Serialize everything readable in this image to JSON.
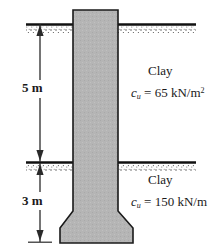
{
  "figure": {
    "colors": {
      "concrete_fill": "#b5b5b5",
      "outline": "#1a1a1a",
      "ground_line": "#111111",
      "stipple": "#4a4a4a",
      "text": "#1a1a1a",
      "background": "#ffffff"
    }
  },
  "dimensions": [
    {
      "name": "upper-layer-depth",
      "value": "5 m"
    },
    {
      "name": "lower-layer-depth",
      "value": "3 m"
    }
  ],
  "layers": [
    {
      "soil": "Clay",
      "cohesion_symbol": "c",
      "cohesion_subscript": "u",
      "equals": "=",
      "cohesion_value": "65",
      "cohesion_units": "kN/m",
      "cohesion_units_exponent": "2"
    },
    {
      "soil": "Clay",
      "cohesion_symbol": "c",
      "cohesion_subscript": "u",
      "equals": "=",
      "cohesion_value": "150",
      "cohesion_units": "kN/m",
      "cohesion_units_exponent": ""
    }
  ],
  "icons": {
    "ground_surface": "ground-line-icon",
    "dimension_arrow": "dimension-arrow-icon",
    "shaft": "drilled-shaft-icon",
    "bell": "belled-base-icon"
  }
}
